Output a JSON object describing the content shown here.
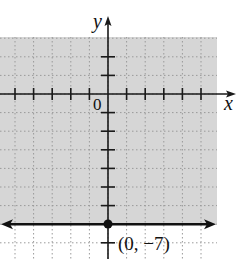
{
  "chart_data": {
    "type": "line",
    "title": "",
    "xlabel": "x",
    "ylabel": "y",
    "origin_label": "0",
    "grid": true,
    "shading": {
      "region": "y >= -7",
      "color": "#d4d4d4",
      "description": "half-plane above boundary line shaded"
    },
    "boundary": {
      "equation": "y = -7",
      "style": "solid",
      "arrows": "both"
    },
    "points": [
      {
        "x": 0,
        "y": -7,
        "label": "(0, −7)"
      }
    ],
    "x_ticks": [
      -5,
      -4,
      -3,
      -2,
      -1,
      1,
      2,
      3,
      4,
      5
    ],
    "y_ticks": [
      2,
      1,
      -1,
      -2,
      -3,
      -4,
      -5,
      -6,
      -7,
      -8
    ],
    "xlim": [
      -6,
      6
    ],
    "ylim": [
      -9,
      3
    ]
  },
  "labels": {
    "x_axis": "x",
    "y_axis": "y",
    "origin": "0",
    "point": "(0, −7)"
  },
  "colors": {
    "shade": "#d6d6d6",
    "axis": "#1a1a1a",
    "grid": "#9a9a9a"
  }
}
